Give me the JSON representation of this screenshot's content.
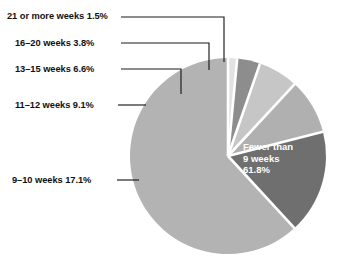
{
  "chart_data": {
    "type": "pie",
    "title": "",
    "categories": [
      "Fewer than 9 weeks",
      "9–10 weeks",
      "11–12 weeks",
      "13–15 weeks",
      "16–20 weeks",
      "21 or more weeks"
    ],
    "values": [
      61.8,
      17.1,
      9.1,
      6.6,
      3.8,
      1.5
    ],
    "value_unit": "%",
    "legend": "none",
    "grid": false,
    "slice_colors": [
      "#b3b3b3",
      "#6f6f6f",
      "#b0b0b0",
      "#c6c6c6",
      "#8d8d8d",
      "#e2e2e2"
    ],
    "separator_color": "#ffffff",
    "start_angle_deg": 0,
    "direction": "counterclockwise",
    "labels": [
      {
        "text": "Fewer than 9 weeks 61.8%",
        "placement": "inside",
        "color": "#ffffff"
      },
      {
        "text": "9–10 weeks 17.1%",
        "placement": "outside-left"
      },
      {
        "text": "11–12 weeks 9.1%",
        "placement": "outside-left"
      },
      {
        "text": "13–15 weeks 6.6%",
        "placement": "outside-left"
      },
      {
        "text": "16–20 weeks 3.8%",
        "placement": "outside-left"
      },
      {
        "text": "21 or more weeks 1.5%",
        "placement": "outside-left"
      }
    ]
  },
  "callouts": {
    "weeks_21_plus": "21 or more weeks 1.5%",
    "weeks_16_20": "16–20 weeks 3.8%",
    "weeks_13_15": "13–15 weeks 6.6%",
    "weeks_11_12": "11–12 weeks 9.1%",
    "weeks_9_10": "9–10 weeks 17.1%"
  },
  "inner_label": {
    "line1": "Fewer than",
    "line2": "9 weeks",
    "line3": "61.8%"
  },
  "colors": {
    "background": "#ffffff",
    "text": "#111111",
    "inner_text": "#ffffff",
    "leader_line": "#1a1a1a"
  }
}
